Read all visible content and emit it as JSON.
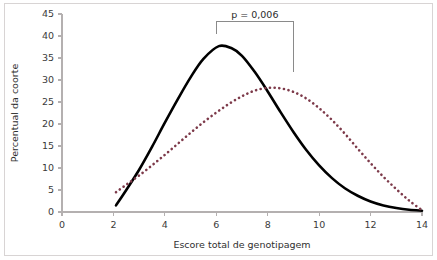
{
  "chart_data": {
    "type": "line",
    "title": "",
    "subtitle": "",
    "xlabel": "Escore total de genotipagem",
    "ylabel": "Percentual da coorte",
    "xlim": [
      0,
      14
    ],
    "ylim": [
      0,
      45
    ],
    "xticks": [
      0,
      2,
      4,
      6,
      8,
      10,
      12,
      14
    ],
    "yticks": [
      0,
      5,
      10,
      15,
      20,
      25,
      30,
      35,
      40,
      45
    ],
    "xtick_labels": [
      "0",
      "2",
      "4",
      "6",
      "8",
      "10",
      "12",
      "14"
    ],
    "ytick_labels": [
      "0",
      "5",
      "10",
      "15",
      "20",
      "25",
      "30",
      "35",
      "40",
      "45"
    ],
    "grid": false,
    "legend": null,
    "legend_position": "none",
    "series": [
      {
        "name": "curva-solida",
        "style": "solid",
        "color": "#000000",
        "width": 2.6,
        "x": [
          2.1,
          2.5,
          3.0,
          3.5,
          4.0,
          4.5,
          5.0,
          5.5,
          6.1,
          6.6,
          7.0,
          7.5,
          8.0,
          8.5,
          9.0,
          9.5,
          10.0,
          10.5,
          11.0,
          11.5,
          12.0,
          12.5,
          13.0,
          13.5,
          14.0
        ],
        "values": [
          1.5,
          5.0,
          9.6,
          14.8,
          20.3,
          25.6,
          30.6,
          34.8,
          37.7,
          37.2,
          35.5,
          31.8,
          27.4,
          22.7,
          18.2,
          14.1,
          10.6,
          7.7,
          5.4,
          3.7,
          2.4,
          1.5,
          0.9,
          0.5,
          0.3
        ]
      },
      {
        "name": "curva-pontilhada",
        "style": "dotted",
        "color": "#7d3a4a",
        "width": 2.6,
        "x": [
          2.1,
          2.5,
          3.0,
          3.5,
          4.0,
          4.5,
          5.0,
          5.5,
          6.0,
          6.5,
          7.0,
          7.5,
          8.0,
          8.5,
          9.0,
          9.5,
          10.0,
          10.5,
          11.0,
          11.5,
          12.0,
          12.5,
          13.0,
          13.5,
          14.0
        ],
        "values": [
          4.5,
          6.2,
          8.3,
          10.6,
          13.0,
          15.5,
          18.0,
          20.4,
          22.6,
          24.6,
          26.3,
          27.6,
          28.2,
          28.1,
          27.3,
          25.8,
          23.6,
          20.9,
          17.8,
          14.4,
          11.1,
          8.0,
          5.2,
          2.6,
          0.4
        ]
      }
    ],
    "annotations": [
      {
        "name": "p-value",
        "text": "p = 0,006",
        "x_start": 6.0,
        "x_end": 9.0,
        "bracket_top": 43.2,
        "left_stem_bottom": 40.4,
        "right_stem_bottom": 31.8
      }
    ]
  },
  "colors": {
    "solid_curve": "#000000",
    "dotted_curve": "#7d3a4a",
    "axis": "#b4b0b0",
    "border": "#d8d4d4",
    "text": "#2f2f2f",
    "bracket": "#8a8a8a",
    "background": "#ffffff"
  }
}
